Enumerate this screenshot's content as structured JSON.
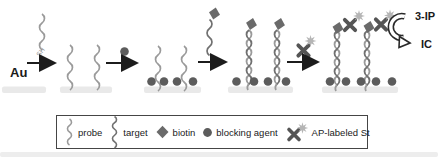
{
  "labels": {
    "electrode": "Au",
    "thiol": "SH",
    "substrate": "3-IP",
    "product": "IC"
  },
  "legend": {
    "items": [
      {
        "icon": "probe-squiggle-icon",
        "label": "probe"
      },
      {
        "icon": "target-squiggle-icon",
        "label": "target"
      },
      {
        "icon": "biotin-diamond-icon",
        "label": "biotin"
      },
      {
        "icon": "blocking-agent-dot-icon",
        "label": "blocking agent"
      },
      {
        "icon": "ap-labeled-st-icon",
        "label": "AP-labeled St"
      }
    ]
  },
  "colors": {
    "probe": "#9a9a9a",
    "target": "#707070",
    "biotin": "#6a6a6a",
    "blocking_agent": "#5c5c5c",
    "streptavidin": "#555555",
    "ap_star": "#b5b5b5",
    "surface": "#e9e9e9",
    "arrow": "#1c1c1c",
    "legend_border": "#454545"
  }
}
